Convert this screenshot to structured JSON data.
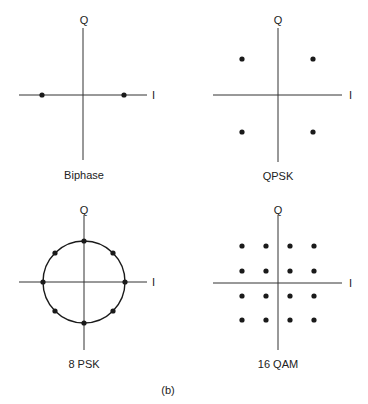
{
  "figure_label": "(b)",
  "colors": {
    "ink": "#1a1a1a",
    "axis": "#333333",
    "background": "#ffffff"
  },
  "panels": [
    {
      "id": "biphase",
      "title": "Biphase",
      "axis_x_label": "I",
      "axis_y_label": "Q",
      "points": [
        [
          -1,
          0
        ],
        [
          1,
          0
        ]
      ]
    },
    {
      "id": "qpsk",
      "title": "QPSK",
      "axis_x_label": "I",
      "axis_y_label": "Q",
      "points": [
        [
          -1,
          1
        ],
        [
          1,
          1
        ],
        [
          -1,
          -1
        ],
        [
          1,
          -1
        ]
      ]
    },
    {
      "id": "8psk",
      "title": "8 PSK",
      "axis_x_label": "I",
      "axis_y_label": "Q",
      "points_on_circle": 8
    },
    {
      "id": "16qam",
      "title": "16 QAM",
      "axis_x_label": "I",
      "axis_y_label": "Q",
      "grid": [
        4,
        4
      ]
    }
  ]
}
